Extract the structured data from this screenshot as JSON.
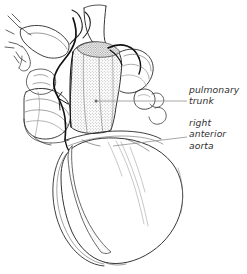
{
  "figure": {
    "type": "anatomical-line-drawing",
    "width": 247,
    "height": 274,
    "background_color": "#ffffff",
    "ink_color": "#1a1a1a",
    "line_color_light": "#555555",
    "leader_color": "#7a7a7a",
    "text_color": "#2f2f2f"
  },
  "annotations": [
    {
      "id": "pulmonary-trunk",
      "lines": [
        "pulmonary",
        "trunk"
      ],
      "leader": {
        "style": "straight",
        "dot_x": 96,
        "dot_y": 101,
        "x1": 96,
        "y1": 101,
        "x2": 187,
        "y2": 101
      }
    },
    {
      "id": "right-anterior-aorta",
      "lines": [
        "right",
        "anterior",
        "aorta"
      ],
      "leader": {
        "style": "straight",
        "dot_x": 113,
        "dot_y": 146,
        "x1": 113,
        "y1": 146,
        "x2": 187,
        "y2": 137
      }
    }
  ],
  "labels": {
    "pulmonary_trunk_line1": "pulmonary",
    "pulmonary_trunk_line2": "trunk",
    "right_anterior_aorta_line1": "right",
    "right_anterior_aorta_line2": "anterior",
    "right_anterior_aorta_line3": "aorta"
  }
}
